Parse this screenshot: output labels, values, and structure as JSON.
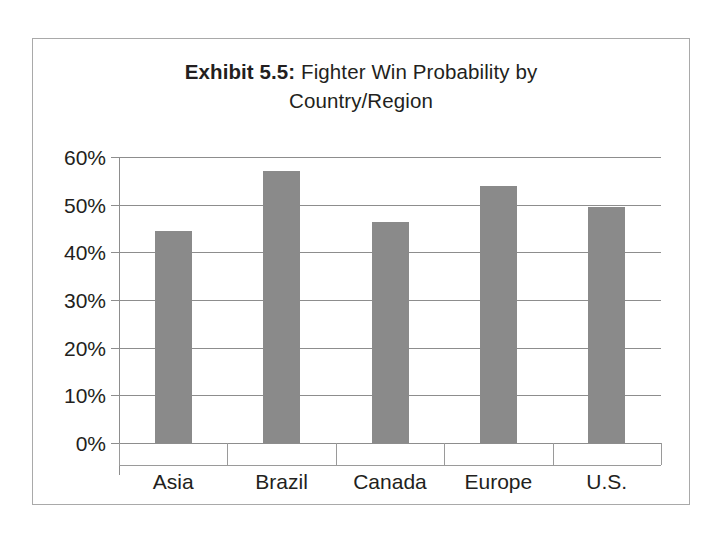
{
  "chart_data": {
    "type": "bar",
    "title": "Exhibit 5.5: Fighter Win Probability by Country/Region",
    "title_bold_prefix": "Exhibit 5.5:",
    "title_rest": " Fighter Win Probability by Country/Region",
    "title_line1_prefix": "Exhibit 5.5:",
    "title_line1_rest": " Fighter Win Probability by",
    "title_line2": "Country/Region",
    "categories": [
      "Asia",
      "Brazil",
      "Canada",
      "Europe",
      "U.S."
    ],
    "values": [
      44.4,
      57.0,
      46.4,
      54.0,
      49.5
    ],
    "value_labels": [
      "44.4%",
      "57.0%",
      "46.4%",
      "54.0%",
      "49.5%"
    ],
    "xlabel": "",
    "ylabel": "",
    "ylim": [
      0,
      60
    ],
    "y_ticks": [
      0,
      10,
      20,
      30,
      40,
      50,
      60
    ],
    "y_tick_labels": [
      "0%",
      "10%",
      "20%",
      "30%",
      "40%",
      "50%",
      "60%"
    ],
    "grid": true,
    "legend": false,
    "series_color": "#8a8a8a",
    "gridline_color": "#8d8d8d",
    "axis_color": "#9a9a9a",
    "text_color": "#231f20",
    "background": "#ffffff"
  }
}
